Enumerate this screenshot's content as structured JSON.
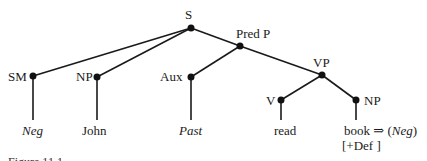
{
  "tree": {
    "nodes": {
      "S": "S",
      "SM": "SM",
      "NP1": "NP",
      "PredP": "Pred P",
      "Aux": "Aux",
      "VP": "VP",
      "V": "V",
      "NP2": "NP"
    },
    "leaves": {
      "neg": "Neg",
      "john": "John",
      "past": "Past",
      "read": "read",
      "book": "book",
      "arrow": "⇒",
      "neg_paren_open": "(",
      "neg2": "Neg",
      "neg_paren_close": ")",
      "def": "[+Def ]"
    }
  },
  "caption": "Figure 11.1"
}
